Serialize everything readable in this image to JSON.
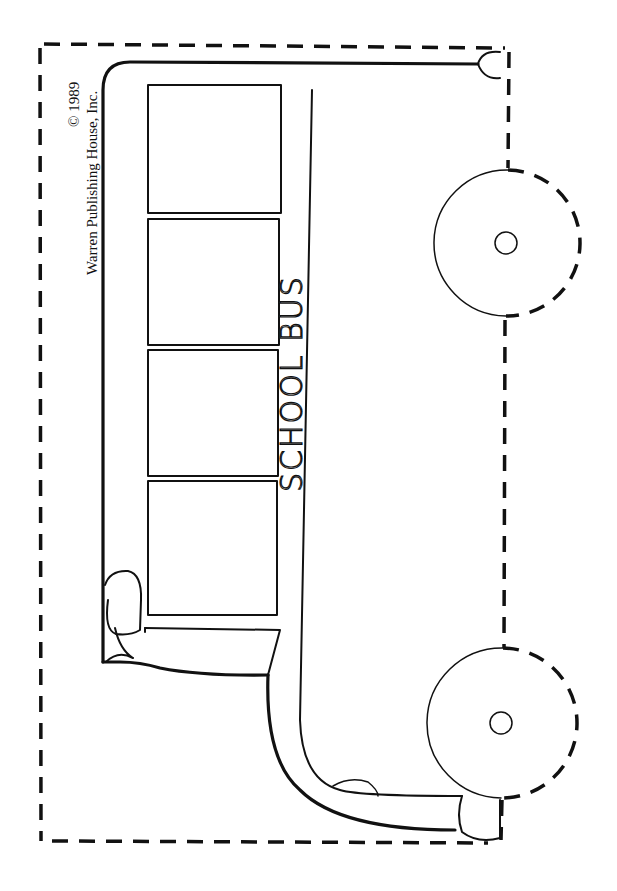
{
  "copyright": {
    "line1": "© 1989",
    "line2": "Warren Publishing House, Inc."
  },
  "bus": {
    "label": "SCHOOL BUS",
    "window_count": 4,
    "wheel_count": 2
  },
  "colors": {
    "ink": "#111111",
    "paper": "#ffffff"
  }
}
